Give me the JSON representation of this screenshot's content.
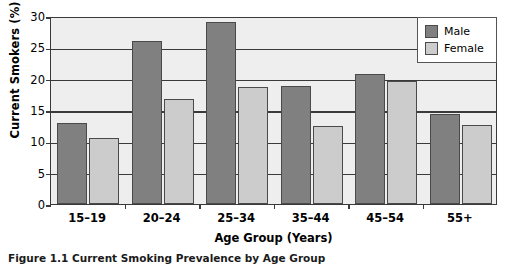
{
  "chart_data": {
    "type": "bar",
    "title": "",
    "xlabel": "Age Group (Years)",
    "ylabel": "Current Smokers (%)",
    "categories": [
      "15–19",
      "20–24",
      "25–34",
      "35–44",
      "45–54",
      "55+"
    ],
    "series": [
      {
        "name": "Male",
        "color": "#808080",
        "values": [
          13.0,
          26.0,
          29.0,
          18.9,
          20.7,
          14.3
        ]
      },
      {
        "name": "Female",
        "color": "#cccccc",
        "values": [
          10.5,
          16.8,
          18.6,
          12.5,
          19.6,
          12.6
        ]
      }
    ],
    "ylim": [
      0,
      30
    ],
    "yticks": [
      0,
      5,
      10,
      15,
      20,
      25,
      30
    ],
    "ytick_labels": [
      "0",
      "5",
      "10",
      "15",
      "20",
      "25",
      "30"
    ],
    "grid": true,
    "legend_position": "top-right",
    "plot_background": "#eeeeee"
  },
  "legend": {
    "entries": [
      {
        "label": "Male"
      },
      {
        "label": "Female"
      }
    ]
  },
  "caption": {
    "text": "Figure 1.1  Current Smoking Prevalence by Age Group"
  }
}
